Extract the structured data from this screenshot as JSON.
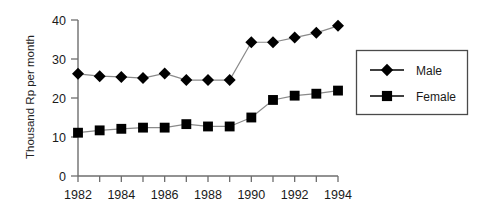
{
  "chart_data": {
    "type": "line",
    "title": "",
    "subtitle": "",
    "xlabel": "",
    "ylabel": "Thousand Rp per month",
    "x": [
      1982,
      1983,
      1984,
      1985,
      1986,
      1987,
      1988,
      1989,
      1990,
      1991,
      1992,
      1993,
      1994
    ],
    "xtick_labels": [
      "1982",
      "1984",
      "1986",
      "1988",
      "1990",
      "1992",
      "1994"
    ],
    "xtick_values": [
      1982,
      1984,
      1986,
      1988,
      1990,
      1992,
      1994
    ],
    "xminor_ticks": [
      1982,
      1983,
      1984,
      1985,
      1986,
      1987,
      1988,
      1989,
      1990,
      1991,
      1992,
      1993,
      1994
    ],
    "ytick_labels": [
      "0",
      "10",
      "20",
      "30",
      "40"
    ],
    "ytick_values": [
      0,
      10,
      20,
      30,
      40
    ],
    "xlim": [
      1982,
      1994
    ],
    "ylim": [
      0,
      40
    ],
    "grid": false,
    "legend_position": "right",
    "series": [
      {
        "name": "Male",
        "marker": "diamond",
        "color": "#000000",
        "values": [
          26.2,
          25.6,
          25.4,
          25.1,
          26.3,
          24.6,
          24.6,
          24.6,
          34.3,
          34.3,
          35.5,
          36.7,
          38.5
        ]
      },
      {
        "name": "Female",
        "marker": "square",
        "color": "#000000",
        "values": [
          11.1,
          11.7,
          12.1,
          12.4,
          12.4,
          13.3,
          12.7,
          12.7,
          15.0,
          19.5,
          20.6,
          21.1,
          21.9
        ]
      }
    ]
  },
  "legend": {
    "items": [
      {
        "label": "Male",
        "marker": "diamond"
      },
      {
        "label": "Female",
        "marker": "square"
      }
    ]
  },
  "colors": {
    "axis": "#6e6e6e",
    "marker": "#000000",
    "line": "#8a8a8a",
    "text": "#1a1a1a",
    "legend_border": "#4a4a4a",
    "background": "#ffffff"
  }
}
